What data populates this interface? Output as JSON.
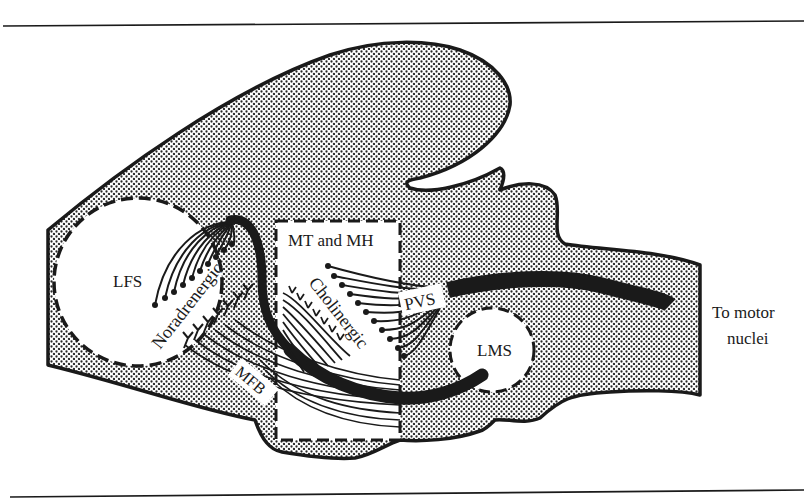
{
  "figure": {
    "type": "anatomical-diagram",
    "colors": {
      "ink": "#1a1a1a",
      "stipple_dot": "#2a2a2a",
      "stipple_bg": "#ffffff",
      "background": "#ffffff"
    }
  },
  "labels": {
    "lfs": "LFS",
    "mt_mh": "MT and MH",
    "noradrenergic": "Noradrenergic",
    "cholinergic": "Cholinergic",
    "pvs": "PVS",
    "mfb": "MFB",
    "lms": "LMS",
    "to_motor_line1": "To motor",
    "to_motor_line2": "nuclei"
  },
  "regions": [
    {
      "id": "lfs",
      "label": "LFS",
      "shape": "dashed-circle"
    },
    {
      "id": "mt_mh",
      "label": "MT and MH",
      "shape": "dashed-rectangle"
    },
    {
      "id": "lms",
      "label": "LMS",
      "shape": "dashed-circle"
    },
    {
      "id": "pvs",
      "label": "PVS",
      "shape": "label-box"
    },
    {
      "id": "mfb",
      "label": "MFB",
      "shape": "label-box"
    }
  ],
  "pathways": [
    {
      "label": "Noradrenergic",
      "from": "LFS",
      "via": "MFB"
    },
    {
      "label": "Cholinergic",
      "from": "MT and MH",
      "to": "PVS"
    },
    {
      "label": "To motor nuclei",
      "from": "PVS"
    }
  ]
}
